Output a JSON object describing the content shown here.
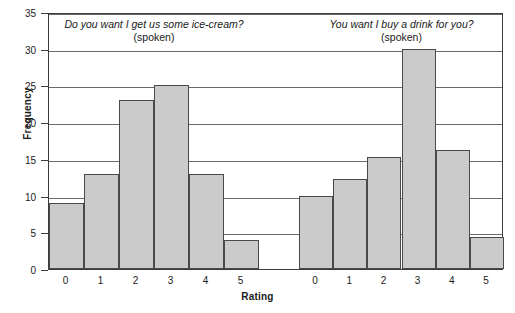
{
  "chart_data": {
    "type": "bar",
    "title": "",
    "xlabel": "Rating",
    "ylabel": "Frequency",
    "ylim": [
      0,
      35
    ],
    "ytick_step": 5,
    "yticks": [
      0,
      5,
      10,
      15,
      20,
      25,
      30,
      35
    ],
    "grid": true,
    "grid_axis": "y",
    "legend": "none",
    "bar_fill": "#cbcbcb",
    "bar_edge": "#4a4a4a",
    "categories": [
      "0",
      "1",
      "2",
      "3",
      "4",
      "5"
    ],
    "panels": [
      {
        "title_line1": "Do you want I get us some ice-cream?",
        "title_line2": "(spoken)",
        "categories": [
          "0",
          "1",
          "2",
          "3",
          "4",
          "5"
        ],
        "values": [
          9,
          13,
          23,
          25,
          13,
          4
        ]
      },
      {
        "title_line1": "You want I buy a drink for you?",
        "title_line2": "(spoken)",
        "categories": [
          "0",
          "1",
          "2",
          "3",
          "4",
          "5"
        ],
        "values": [
          10,
          12.3,
          15.3,
          30,
          16.2,
          4.3
        ]
      }
    ]
  },
  "axis": {
    "ylabel": "Frequency",
    "xlabel": "Rating",
    "ytick_labels": [
      "0",
      "5",
      "10",
      "15",
      "20",
      "25",
      "30",
      "35"
    ]
  }
}
